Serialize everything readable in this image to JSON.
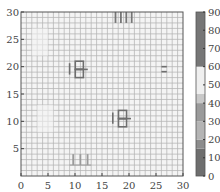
{
  "chart_data": {
    "type": "heatmap",
    "title": "",
    "xlabel": "",
    "ylabel": "",
    "xlim": [
      0,
      30
    ],
    "ylim": [
      0,
      30
    ],
    "x_ticks": [
      "0",
      "5",
      "10",
      "15",
      "20",
      "25",
      "30"
    ],
    "y_ticks": [
      "5",
      "10",
      "15",
      "20",
      "25",
      "30"
    ],
    "colorbar": {
      "ticks": [
        "0",
        "10",
        "20",
        "30",
        "40",
        "50",
        "60",
        "70",
        "80",
        "90"
      ],
      "range": [
        0,
        90
      ],
      "bands": [
        {
          "from": 0,
          "to": 15,
          "color": "#6e6e6e"
        },
        {
          "from": 15,
          "to": 20,
          "color": "#8c8c8c"
        },
        {
          "from": 20,
          "to": 30,
          "color": "#b4b4b4"
        },
        {
          "from": 30,
          "to": 40,
          "color": "#9a9a9a"
        },
        {
          "from": 40,
          "to": 45,
          "color": "#c8c8c8"
        },
        {
          "from": 45,
          "to": 60,
          "color": "#efefef"
        },
        {
          "from": 60,
          "to": 90,
          "color": "#767676"
        }
      ]
    },
    "grid": true,
    "background_value": 50,
    "grid_line_value": 20,
    "features": [
      {
        "name": "glyph-upper-left",
        "x_range": [
          9,
          12
        ],
        "y_range": [
          18,
          21
        ],
        "value": 5
      },
      {
        "name": "glyph-center-right",
        "x_range": [
          17,
          20
        ],
        "y_range": [
          9,
          12
        ],
        "value": 5
      },
      {
        "name": "bars-top",
        "x_range": [
          17,
          21
        ],
        "y_range": [
          28,
          30
        ],
        "value": 80
      },
      {
        "name": "bars-bottom",
        "x_range": [
          9,
          13
        ],
        "y_range": [
          2,
          4
        ],
        "value": 35
      },
      {
        "name": "marks-right",
        "x_range": [
          26,
          27
        ],
        "y_range": [
          18.5,
          20
        ],
        "value": 10
      }
    ]
  }
}
